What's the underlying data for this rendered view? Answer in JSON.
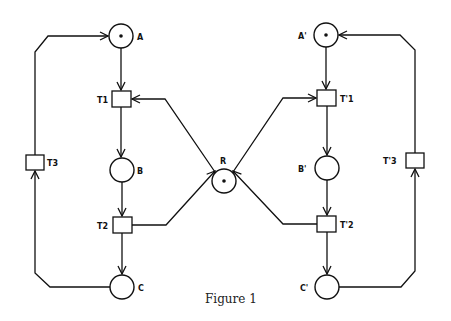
{
  "figure": {
    "caption": "Figure 1",
    "places": [
      {
        "id": "A",
        "label": "A",
        "tokens": 1
      },
      {
        "id": "B",
        "label": "B",
        "tokens": 0
      },
      {
        "id": "C",
        "label": "C",
        "tokens": 0
      },
      {
        "id": "R",
        "label": "R",
        "tokens": 1
      },
      {
        "id": "A'",
        "label": "A'",
        "tokens": 1
      },
      {
        "id": "B'",
        "label": "B'",
        "tokens": 0
      },
      {
        "id": "C'",
        "label": "C'",
        "tokens": 0
      }
    ],
    "transitions": [
      {
        "id": "T1",
        "label": "T1"
      },
      {
        "id": "T2",
        "label": "T2"
      },
      {
        "id": "T3",
        "label": "T3"
      },
      {
        "id": "T'1",
        "label": "T'1"
      },
      {
        "id": "T'2",
        "label": "T'2"
      },
      {
        "id": "T'3",
        "label": "T'3"
      }
    ],
    "arcs": [
      [
        "A",
        "T1"
      ],
      [
        "T1",
        "B"
      ],
      [
        "B",
        "T2"
      ],
      [
        "T2",
        "C"
      ],
      [
        "C",
        "T3"
      ],
      [
        "T3",
        "A"
      ],
      [
        "R",
        "T1"
      ],
      [
        "T2",
        "R"
      ],
      [
        "A'",
        "T'1"
      ],
      [
        "T'1",
        "B'"
      ],
      [
        "B'",
        "T'2"
      ],
      [
        "T'2",
        "C'"
      ],
      [
        "C'",
        "T'3"
      ],
      [
        "T'3",
        "A'"
      ],
      [
        "R",
        "T'1"
      ],
      [
        "T'2",
        "R"
      ]
    ],
    "colors": {
      "stroke": "#111111",
      "background": "#ffffff"
    }
  }
}
